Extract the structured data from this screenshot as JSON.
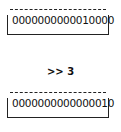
{
  "top_register": {
    "value": "0000000000010000"
  },
  "operation": {
    "label": ">> 3"
  },
  "bottom_register": {
    "value": "0000000000000010"
  }
}
